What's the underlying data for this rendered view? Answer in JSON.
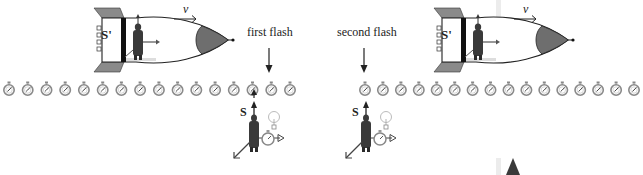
{
  "diagram": {
    "left_panel": {
      "rocket": {
        "frame_label": "S'",
        "velocity_label": "v"
      },
      "flash_label": "first flash",
      "clock_count": 16,
      "observer": {
        "frame_label": "S"
      }
    },
    "right_panel": {
      "rocket": {
        "frame_label": "S'",
        "velocity_label": "v"
      },
      "flash_label": "second flash",
      "clock_count": 16,
      "observer": {
        "frame_label": "S"
      }
    },
    "colors": {
      "outline": "#222222",
      "fin_gray": "#8a8a8a",
      "nose_gray": "#6e6e6e",
      "clock_gray": "#9a9a9a",
      "figure_dark": "#3a3a3a"
    }
  }
}
